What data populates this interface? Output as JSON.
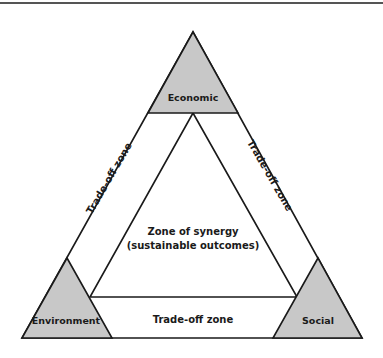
{
  "diagram": {
    "nodes": {
      "economic": "Economic",
      "environment": "Environment",
      "social": "Social"
    },
    "zones": {
      "left": "Trade-off zone",
      "right": "Trade-off zone",
      "bottom": "Trade-off zone",
      "center_line1": "Zone of synergy",
      "center_line2": "(sustainable outcomes)"
    },
    "colors": {
      "node_fill": "#c8c8c8",
      "stroke": "#1a1a1a",
      "background": "#ffffff"
    }
  }
}
